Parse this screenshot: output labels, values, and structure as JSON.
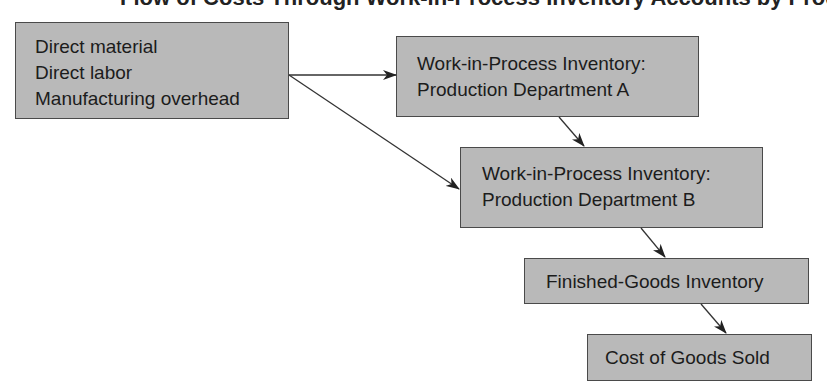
{
  "title": "Flow of Costs Through Work-in-Process Inventory Accounts by Production Department",
  "boxes": {
    "inputs": {
      "lines": [
        "Direct material",
        "Direct labor",
        "Manufacturing overhead"
      ]
    },
    "wip_a": {
      "lines": [
        "Work-in-Process Inventory:",
        "Production Department A"
      ]
    },
    "wip_b": {
      "lines": [
        "Work-in-Process Inventory:",
        "Production Department B"
      ]
    },
    "finished_goods": {
      "lines": [
        "Finished-Goods Inventory"
      ]
    },
    "cogs": {
      "lines": [
        "Cost of Goods Sold"
      ]
    }
  },
  "flows": [
    {
      "from": "inputs",
      "to": "wip_a"
    },
    {
      "from": "inputs",
      "to": "wip_b"
    },
    {
      "from": "wip_a",
      "to": "wip_b"
    },
    {
      "from": "wip_b",
      "to": "finished_goods"
    },
    {
      "from": "finished_goods",
      "to": "cogs"
    }
  ],
  "colors": {
    "box_fill": "#b9b9b9",
    "box_border": "#4a4a4a",
    "arrow": "#222222"
  }
}
